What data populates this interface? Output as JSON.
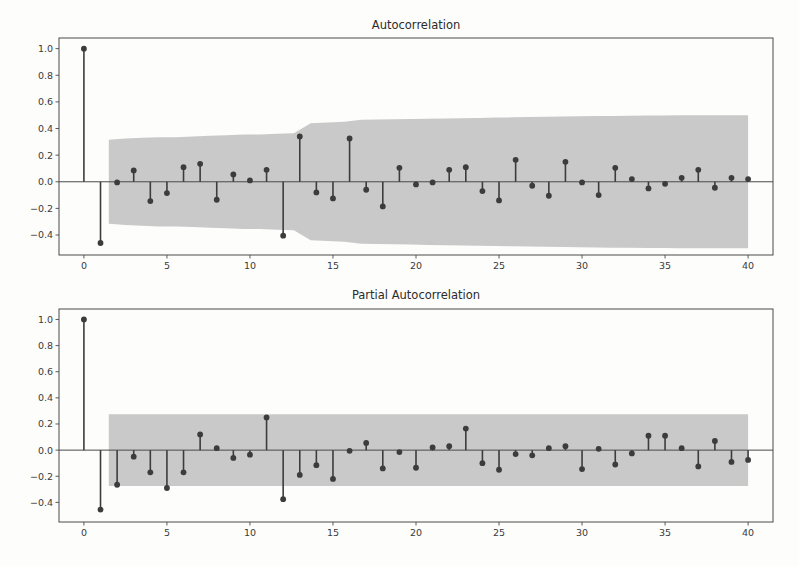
{
  "figure": {
    "background_color": "#fdfdfc",
    "stem_color": "#3c3c3c",
    "band_color": "#c9c9c9",
    "axis_color": "#4a4a4a"
  },
  "chart_data": [
    {
      "type": "line",
      "plot_kind": "stem-correlogram",
      "title": "Autocorrelation",
      "xlabel": "",
      "ylabel": "",
      "xlim": [
        -1.5,
        41.5
      ],
      "ylim": [
        -0.55,
        1.08
      ],
      "xticks": [
        0,
        5,
        10,
        15,
        20,
        25,
        30,
        35,
        40
      ],
      "xtick_labels": [
        "0",
        "5",
        "10",
        "15",
        "20",
        "25",
        "30",
        "35",
        "40"
      ],
      "yticks": [
        1.0,
        0.8,
        0.6,
        0.4,
        0.2,
        0.0,
        -0.2,
        -0.4
      ],
      "ytick_labels": [
        "1.0",
        "0.8",
        "0.6",
        "0.4",
        "0.2",
        "0.0",
        "−0.2",
        "−0.4"
      ],
      "grid": false,
      "legend": null,
      "x": [
        0,
        1,
        2,
        3,
        4,
        5,
        6,
        7,
        8,
        9,
        10,
        11,
        12,
        13,
        14,
        15,
        16,
        17,
        18,
        19,
        20,
        21,
        22,
        23,
        24,
        25,
        26,
        27,
        28,
        29,
        30,
        31,
        32,
        33,
        34,
        35,
        36,
        37,
        38,
        39,
        40
      ],
      "values": [
        1.0,
        -0.46,
        -0.005,
        0.085,
        -0.145,
        -0.085,
        0.11,
        0.135,
        -0.135,
        0.055,
        0.01,
        0.09,
        -0.405,
        0.34,
        -0.08,
        -0.125,
        0.325,
        -0.06,
        -0.185,
        0.105,
        -0.02,
        -0.005,
        0.09,
        0.11,
        -0.07,
        -0.14,
        0.165,
        -0.03,
        -0.105,
        0.15,
        -0.005,
        -0.1,
        0.105,
        0.02,
        -0.05,
        -0.015,
        0.03,
        0.09,
        -0.045,
        0.03,
        0.02
      ],
      "confidence_band": {
        "label": "95% confidence interval",
        "start_lag": 1.5,
        "upper": [
          0.315,
          0.325,
          0.33,
          0.335,
          0.335,
          0.34,
          0.345,
          0.35,
          0.355,
          0.355,
          0.36,
          0.365,
          0.44,
          0.445,
          0.45,
          0.465,
          0.468,
          0.47,
          0.472,
          0.474,
          0.476,
          0.478,
          0.48,
          0.482,
          0.484,
          0.486,
          0.488,
          0.49,
          0.492,
          0.494,
          0.495,
          0.496,
          0.497,
          0.498,
          0.499,
          0.5,
          0.5,
          0.5,
          0.5
        ],
        "lower": [
          -0.315,
          -0.325,
          -0.33,
          -0.335,
          -0.335,
          -0.34,
          -0.345,
          -0.35,
          -0.355,
          -0.355,
          -0.36,
          -0.365,
          -0.44,
          -0.445,
          -0.45,
          -0.465,
          -0.468,
          -0.47,
          -0.472,
          -0.474,
          -0.476,
          -0.478,
          -0.48,
          -0.482,
          -0.484,
          -0.486,
          -0.488,
          -0.49,
          -0.492,
          -0.494,
          -0.495,
          -0.496,
          -0.497,
          -0.498,
          -0.499,
          -0.5,
          -0.5,
          -0.5,
          -0.5
        ],
        "end_lag": 40
      }
    },
    {
      "type": "line",
      "plot_kind": "stem-correlogram",
      "title": "Partial Autocorrelation",
      "xlabel": "",
      "ylabel": "",
      "xlim": [
        -1.5,
        41.5
      ],
      "ylim": [
        -0.55,
        1.08
      ],
      "xticks": [
        0,
        5,
        10,
        15,
        20,
        25,
        30,
        35,
        40
      ],
      "xtick_labels": [
        "0",
        "5",
        "10",
        "15",
        "20",
        "25",
        "30",
        "35",
        "40"
      ],
      "yticks": [
        1.0,
        0.8,
        0.6,
        0.4,
        0.2,
        0.0,
        -0.2,
        -0.4
      ],
      "ytick_labels": [
        "1.0",
        "0.8",
        "0.6",
        "0.4",
        "0.2",
        "0.0",
        "−0.2",
        "−0.4"
      ],
      "grid": false,
      "legend": null,
      "x": [
        0,
        1,
        2,
        3,
        4,
        5,
        6,
        7,
        8,
        9,
        10,
        11,
        12,
        13,
        14,
        15,
        16,
        17,
        18,
        19,
        20,
        21,
        22,
        23,
        24,
        25,
        26,
        27,
        28,
        29,
        30,
        31,
        32,
        33,
        34,
        35,
        36,
        37,
        38,
        39,
        40
      ],
      "values": [
        1.0,
        -0.455,
        -0.265,
        -0.05,
        -0.17,
        -0.29,
        -0.17,
        0.12,
        0.015,
        -0.06,
        -0.035,
        0.25,
        -0.375,
        -0.19,
        -0.115,
        -0.22,
        -0.005,
        0.055,
        -0.14,
        -0.015,
        -0.135,
        0.02,
        0.03,
        0.165,
        -0.1,
        -0.15,
        -0.03,
        -0.04,
        0.015,
        0.03,
        -0.145,
        0.01,
        -0.11,
        -0.025,
        0.11,
        0.11,
        0.015,
        -0.125,
        0.07,
        -0.09,
        -0.075
      ],
      "confidence_band": {
        "label": "95% confidence interval",
        "start_lag": 1.5,
        "upper": 0.275,
        "lower": -0.275,
        "end_lag": 40
      }
    }
  ]
}
